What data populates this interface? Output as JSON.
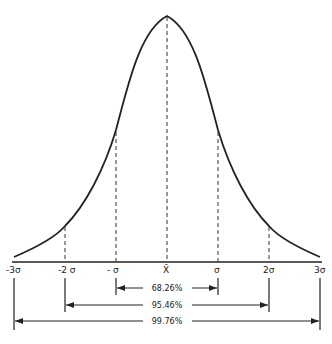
{
  "diagram": {
    "axis_labels": {
      "m3": "-3σ",
      "m2": "-2 σ",
      "m1": "- σ",
      "mean": "X̄",
      "p1": "σ",
      "p2": "2σ",
      "p3": "3σ"
    },
    "ranges": [
      {
        "label": "68.26%",
        "from": "-σ",
        "to": "σ"
      },
      {
        "label": "95.46%",
        "from": "-2σ",
        "to": "2σ"
      },
      {
        "label": "99.76%",
        "from": "-3σ",
        "to": "3σ"
      }
    ],
    "colors": {
      "ink": "#222222",
      "background": "#ffffff"
    }
  }
}
